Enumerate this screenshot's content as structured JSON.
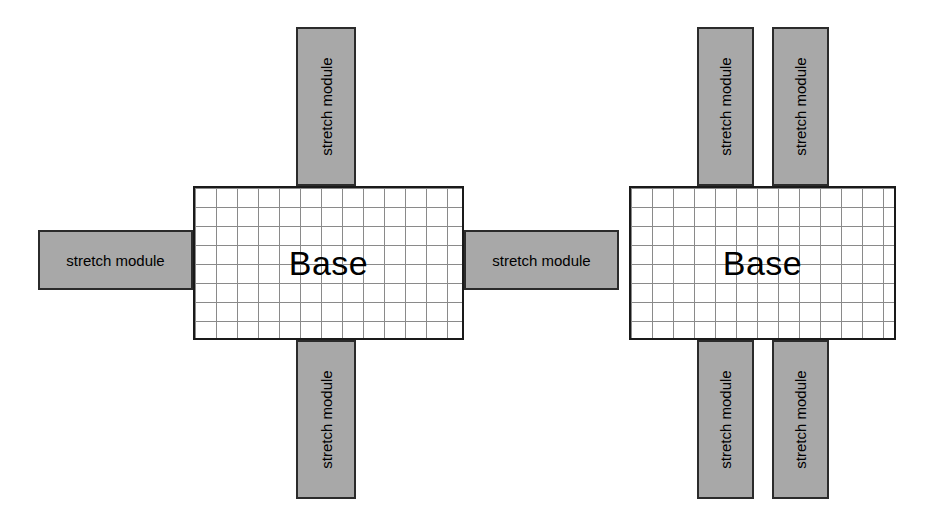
{
  "diagram": {
    "colors": {
      "module_fill": "#a8a8a8",
      "module_border": "#2b2b2b",
      "base_border": "#1a1a1a",
      "base_fill": "#ffffff",
      "grid_line": "#8a8a8a",
      "background": "#ffffff",
      "text": "#000000"
    },
    "base_grid": {
      "columns": 13,
      "rows": 8,
      "cell_width": 21,
      "cell_height": 19
    },
    "configurations": [
      {
        "name": "single-stretch-per-side",
        "base": {
          "label": "Base",
          "x": 193,
          "y": 186,
          "width": 271,
          "height": 154
        },
        "modules": [
          {
            "name": "top-module",
            "label": "stretch module",
            "orientation": "vertical",
            "x": 296,
            "y": 27,
            "width": 60,
            "height": 159
          },
          {
            "name": "left-module",
            "label": "stretch module",
            "orientation": "horizontal",
            "x": 38,
            "y": 230,
            "width": 155,
            "height": 60
          },
          {
            "name": "right-module",
            "label": "stretch module",
            "orientation": "horizontal",
            "x": 464,
            "y": 230,
            "width": 155,
            "height": 60
          },
          {
            "name": "bottom-module",
            "label": "stretch module",
            "orientation": "vertical",
            "x": 296,
            "y": 340,
            "width": 60,
            "height": 159
          }
        ]
      },
      {
        "name": "double-stretch-top-and-bottom",
        "base": {
          "label": "Base",
          "x": 629,
          "y": 186,
          "width": 267,
          "height": 154
        },
        "modules": [
          {
            "name": "top-module-left",
            "label": "stretch module",
            "orientation": "vertical",
            "x": 697,
            "y": 27,
            "width": 57,
            "height": 159
          },
          {
            "name": "top-module-right",
            "label": "stretch module",
            "orientation": "vertical",
            "x": 772,
            "y": 27,
            "width": 57,
            "height": 159
          },
          {
            "name": "bottom-module-left",
            "label": "stretch module",
            "orientation": "vertical",
            "x": 697,
            "y": 340,
            "width": 57,
            "height": 159
          },
          {
            "name": "bottom-module-right",
            "label": "stretch module",
            "orientation": "vertical",
            "x": 772,
            "y": 340,
            "width": 57,
            "height": 159
          }
        ]
      }
    ]
  }
}
